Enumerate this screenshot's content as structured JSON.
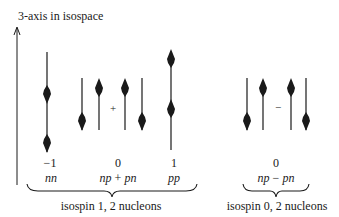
{
  "axis": {
    "label": "3-axis in isospace"
  },
  "isospin1": {
    "states": [
      {
        "name": "nn",
        "value": "−1",
        "combo": "nn"
      },
      {
        "name": "np+pn",
        "value": "0",
        "combo_a": "np",
        "op": "+",
        "combo_b": "pn"
      },
      {
        "name": "pp",
        "value": "1",
        "combo": "pp"
      }
    ],
    "brace_label": "isospin 1, 2 nucleons"
  },
  "isospin0": {
    "value": "0",
    "combo_a": "np",
    "op": "−",
    "combo_b": "pn",
    "diagram_op": "−",
    "brace_label": "isospin 0, 2 nucleons"
  },
  "diagram_ops": {
    "plus": "+",
    "minus": "−"
  },
  "colors": {
    "ink": "#1a1a1a",
    "background": "#ffffff"
  }
}
